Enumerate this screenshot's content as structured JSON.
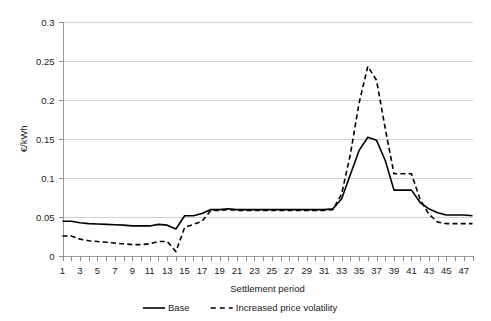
{
  "chart_data": {
    "type": "line",
    "title": "",
    "xlabel": "Settlement period",
    "ylabel": "€/kWh",
    "xlim": [
      1,
      48
    ],
    "ylim": [
      0,
      0.3
    ],
    "yticks": [
      0,
      0.05,
      0.1,
      0.15,
      0.2,
      0.25,
      0.3
    ],
    "ytick_labels": [
      "0",
      "0.05",
      "0.1",
      "0.15",
      "0.2",
      "0.25",
      "0.3"
    ],
    "xticks": [
      1,
      2,
      3,
      4,
      5,
      6,
      7,
      8,
      9,
      10,
      11,
      12,
      13,
      14,
      15,
      16,
      17,
      18,
      19,
      20,
      21,
      22,
      23,
      24,
      25,
      26,
      27,
      28,
      29,
      30,
      31,
      32,
      33,
      34,
      35,
      36,
      37,
      38,
      39,
      40,
      41,
      42,
      43,
      44,
      45,
      46,
      47,
      48
    ],
    "xtick_labels": [
      "1",
      "3",
      "5",
      "7",
      "9",
      "11",
      "13",
      "15",
      "17",
      "19",
      "21",
      "23",
      "25",
      "27",
      "29",
      "31",
      "33",
      "35",
      "37",
      "39",
      "41",
      "43",
      "45",
      "47"
    ],
    "xtick_label_values": [
      1,
      3,
      5,
      7,
      9,
      11,
      13,
      15,
      17,
      19,
      21,
      23,
      25,
      27,
      29,
      31,
      33,
      35,
      37,
      39,
      41,
      43,
      45,
      47
    ],
    "grid": true,
    "grid_axis": "y",
    "legend_position": "bottom",
    "x": [
      1,
      2,
      3,
      4,
      5,
      6,
      7,
      8,
      9,
      10,
      11,
      12,
      13,
      14,
      15,
      16,
      17,
      18,
      19,
      20,
      21,
      22,
      23,
      24,
      25,
      26,
      27,
      28,
      29,
      30,
      31,
      32,
      33,
      34,
      35,
      36,
      37,
      38,
      39,
      40,
      41,
      42,
      43,
      44,
      45,
      46,
      47,
      48
    ],
    "series": [
      {
        "name": "Base",
        "style": "solid",
        "color": "#000000",
        "values": [
          0.044,
          0.044,
          0.042,
          0.041,
          0.0405,
          0.04,
          0.0395,
          0.039,
          0.038,
          0.038,
          0.038,
          0.04,
          0.039,
          0.034,
          0.051,
          0.051,
          0.054,
          0.059,
          0.059,
          0.06,
          0.059,
          0.059,
          0.059,
          0.059,
          0.059,
          0.059,
          0.059,
          0.059,
          0.059,
          0.059,
          0.059,
          0.06,
          0.073,
          0.104,
          0.135,
          0.152,
          0.148,
          0.122,
          0.084,
          0.084,
          0.084,
          0.068,
          0.06,
          0.055,
          0.052,
          0.052,
          0.052,
          0.051
        ]
      },
      {
        "name": "Increased price volatility",
        "style": "dashed",
        "color": "#000000",
        "values": [
          0.025,
          0.025,
          0.021,
          0.019,
          0.018,
          0.017,
          0.016,
          0.015,
          0.014,
          0.014,
          0.015,
          0.018,
          0.018,
          0.005,
          0.036,
          0.04,
          0.044,
          0.058,
          0.058,
          0.059,
          0.058,
          0.058,
          0.058,
          0.058,
          0.058,
          0.058,
          0.058,
          0.058,
          0.058,
          0.058,
          0.058,
          0.059,
          0.079,
          0.13,
          0.196,
          0.243,
          0.225,
          0.163,
          0.105,
          0.105,
          0.105,
          0.072,
          0.053,
          0.043,
          0.041,
          0.041,
          0.041,
          0.041
        ]
      }
    ]
  },
  "legend": {
    "items": [
      {
        "label": "Base",
        "style": "solid"
      },
      {
        "label": "Increased price volatility",
        "style": "dashed"
      }
    ]
  },
  "axes": {
    "x_title": "Settlement period",
    "y_title": "€/kWh"
  }
}
